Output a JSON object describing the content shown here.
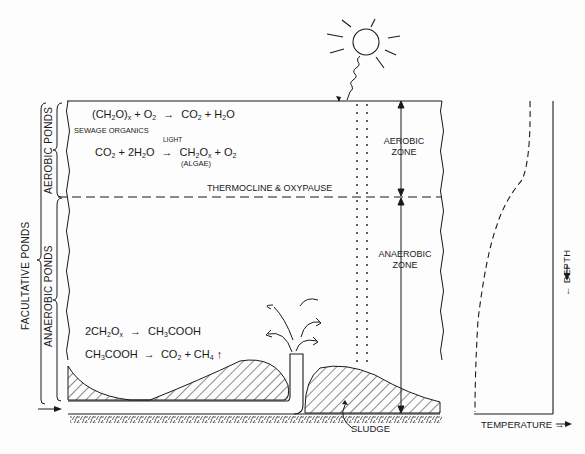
{
  "diagram": {
    "type": "facultative-pond-cross-section",
    "side_labels": {
      "outer": "FACULTATIVE  PONDS",
      "upper": "AEROBIC  PONDS",
      "lower": "ANAEROBIC  PONDS"
    },
    "aerobic_equations": {
      "eq1": {
        "lhs_a": "(CH",
        "lhs_a_sub": "2",
        "lhs_b": "O)",
        "lhs_b_sub": "x",
        "lhs_c": " + O",
        "lhs_c_sub": "2",
        "arrow": "→",
        "rhs_a": "CO",
        "rhs_a_sub": "2",
        "rhs_b": " + H",
        "rhs_b_sub": "2",
        "rhs_c": "O"
      },
      "eq1_note": "SEWAGE ORGANICS",
      "eq2": {
        "lhs_a": "CO",
        "lhs_a_sub": "2",
        "lhs_b": " + 2H",
        "lhs_b_sub": "2",
        "lhs_c": "O",
        "arrow": "→",
        "arrow_label": "LIGHT",
        "rhs_a": "CH",
        "rhs_a_sub": "2",
        "rhs_b": "O",
        "rhs_b_sub": "x",
        "rhs_c": " + O",
        "rhs_c_sub": "2"
      },
      "eq2_note": "(ALGAE)"
    },
    "anaerobic_equations": {
      "eq3": {
        "lhs_a": "2CH",
        "lhs_a_sub": "2",
        "lhs_b": "O",
        "lhs_b_sub": "x",
        "arrow": "→",
        "rhs_a": "CH",
        "rhs_a_sub": "3",
        "rhs_b": "COOH"
      },
      "eq4": {
        "lhs_a": "CH",
        "lhs_a_sub": "3",
        "lhs_b": "COOH",
        "arrow": "→",
        "rhs_a": "CO",
        "rhs_a_sub": "2",
        "rhs_b": " + CH",
        "rhs_b_sub": "4",
        "rhs_c": " ↑"
      }
    },
    "thermocline_label": "THERMOCLINE  &  OXYPAUSE",
    "zones": {
      "aerobic": [
        "AEROBIC",
        "ZONE"
      ],
      "anaerobic": [
        "ANAEROBIC",
        "ZONE"
      ]
    },
    "sludge_label": "SLUDGE",
    "profile": {
      "y_label": "← DEPTH",
      "x_label": "TEMPERATURE →"
    },
    "colors": {
      "ink": "#1a1a1a",
      "paper": "#fdfdfd"
    }
  }
}
